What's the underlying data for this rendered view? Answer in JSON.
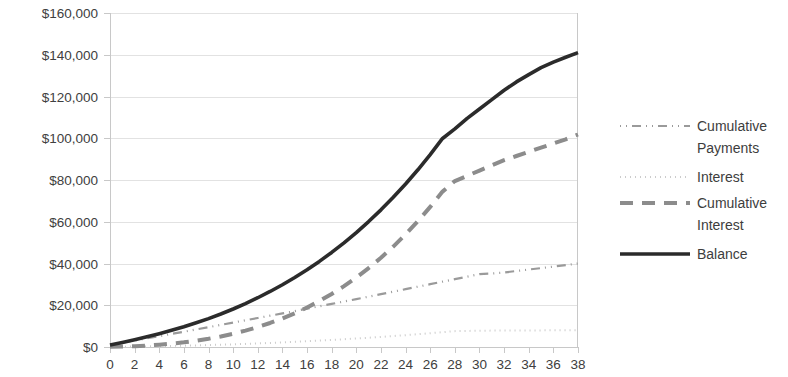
{
  "chart_data": {
    "type": "line",
    "title": "",
    "subtitle": "",
    "xlabel": "",
    "ylabel": "",
    "xlim": [
      0,
      38
    ],
    "ylim": [
      0,
      160000
    ],
    "grid": "horizontal",
    "legend_position": "right",
    "y_ticks": [
      0,
      20000,
      40000,
      60000,
      80000,
      100000,
      120000,
      140000,
      160000
    ],
    "y_tick_labels": [
      "$0",
      "$20,000",
      "$40,000",
      "$60,000",
      "$80,000",
      "$100,000",
      "$120,000",
      "$140,000",
      "$160,000"
    ],
    "x_ticks": [
      0,
      2,
      4,
      6,
      8,
      10,
      12,
      14,
      16,
      18,
      20,
      22,
      24,
      26,
      28,
      30,
      32,
      34,
      36,
      38
    ],
    "x_tick_labels": [
      "0",
      "2",
      "4",
      "6",
      "8",
      "10",
      "12",
      "14",
      "16",
      "18",
      "20",
      "22",
      "24",
      "26",
      "28",
      "30",
      "32",
      "34",
      "36",
      "38"
    ],
    "x": [
      0,
      1,
      2,
      3,
      4,
      5,
      6,
      7,
      8,
      9,
      10,
      11,
      12,
      13,
      14,
      15,
      16,
      17,
      18,
      19,
      20,
      21,
      22,
      23,
      24,
      25,
      26,
      27,
      28,
      29,
      30,
      31,
      32,
      33,
      34,
      35,
      36,
      37,
      38
    ],
    "series": [
      {
        "name": "Cumulative Payments",
        "color": "#9a9a9a",
        "width": 2.2,
        "dash": "1,5,1,5,9,5",
        "values": [
          1000,
          2050,
          3100,
          4150,
          5200,
          6250,
          7300,
          8400,
          9500,
          10600,
          11700,
          12800,
          13900,
          15000,
          16100,
          17200,
          18350,
          19500,
          20650,
          21800,
          22950,
          24100,
          25300,
          26500,
          27700,
          28900,
          30100,
          31300,
          32500,
          33700,
          34900,
          35200,
          35700,
          36400,
          37100,
          37800,
          38500,
          39250,
          40000
        ]
      },
      {
        "name": "Interest",
        "color": "#cbcbcb",
        "width": 2.0,
        "dash": "1,4",
        "values": [
          60,
          130,
          210,
          300,
          400,
          510,
          640,
          780,
          930,
          1100,
          1290,
          1490,
          1710,
          1950,
          2200,
          2470,
          2760,
          3060,
          3380,
          3720,
          4080,
          4450,
          4840,
          5250,
          5680,
          6130,
          6600,
          7090,
          7600,
          7700,
          7800,
          7850,
          7880,
          7900,
          7930,
          7960,
          7980,
          8000,
          8050
        ]
      },
      {
        "name": "Cumulative Interest",
        "color": "#8c8c8c",
        "width": 4.0,
        "dash": "13,9",
        "values": [
          60,
          190,
          400,
          700,
          1100,
          1610,
          2250,
          3030,
          3960,
          5060,
          6350,
          7840,
          9550,
          11500,
          13700,
          16170,
          18930,
          22000,
          25400,
          29150,
          33280,
          37800,
          42740,
          48120,
          53960,
          60280,
          67100,
          74440,
          79500,
          82000,
          84500,
          87000,
          89500,
          91500,
          93500,
          95500,
          97500,
          99500,
          101800
        ]
      },
      {
        "name": "Balance",
        "color": "#2b2b2b",
        "width": 3.6,
        "dash": "none",
        "values": [
          1000,
          2200,
          3500,
          4900,
          6400,
          8000,
          9700,
          11600,
          13600,
          15800,
          18200,
          20800,
          23600,
          26600,
          29800,
          33300,
          37000,
          41000,
          45300,
          49900,
          54800,
          60100,
          65700,
          71700,
          78100,
          84900,
          92200,
          99900,
          104500,
          109500,
          114000,
          118500,
          123000,
          127000,
          130500,
          133800,
          136500,
          138800,
          141000
        ]
      }
    ],
    "legend_entries": [
      {
        "label": "Cumulative Payments",
        "color": "#9a9a9a",
        "dash": "1,5,1,5,9,5",
        "width": 2.2
      },
      {
        "label": "Interest",
        "color": "#cbcbcb",
        "dash": "1,4",
        "width": 2.0
      },
      {
        "label": "Cumulative Interest",
        "color": "#8c8c8c",
        "dash": "13,9",
        "width": 4.0
      },
      {
        "label": "Balance",
        "color": "#2b2b2b",
        "dash": "none",
        "width": 3.6
      }
    ]
  },
  "style": {
    "background": "#ffffff",
    "gridline_color": "#e2e2e2",
    "axis_color": "#c8c8c8",
    "tick_text_color": "#404040",
    "legend_text_color": "#3d3d3d"
  },
  "plot_geometry": {
    "left": 110,
    "right": 578,
    "top": 13,
    "bottom": 347
  }
}
